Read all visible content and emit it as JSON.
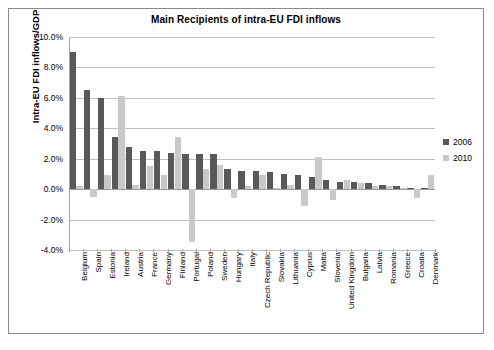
{
  "chart_data": {
    "type": "bar",
    "title": "Main Recipients of intra-EU FDI inflows",
    "xlabel": "",
    "ylabel": "Intra-EU FDI inflows/GDP",
    "ylim": [
      -4.0,
      10.0
    ],
    "ytick_step": 2.0,
    "ytick_labels": [
      "10.0%",
      "8.0%",
      "6.0%",
      "4.0%",
      "2.0%",
      "0.0%",
      "-2.0%",
      "-4.0%"
    ],
    "ytick_values": [
      10.0,
      8.0,
      6.0,
      4.0,
      2.0,
      0.0,
      -2.0,
      -4.0
    ],
    "grid": true,
    "legend_position": "right",
    "value_suffix": "%",
    "categories": [
      "Belgium",
      "Spain",
      "Estonia",
      "Ireland",
      "Austria",
      "France",
      "Germany",
      "Finland",
      "Portugal",
      "Poland",
      "Sweden",
      "Hungary",
      "Italy",
      "Czech Republic",
      "Slovakia",
      "Lithuania",
      "Cyprus",
      "Malta",
      "Slovenia",
      "United Kingdom",
      "Bulgaria",
      "Latvia",
      "Romania",
      "Greece",
      "Croatia",
      "Denmark"
    ],
    "series": [
      {
        "name": "2006",
        "color": "#595959",
        "values": [
          9.0,
          6.5,
          6.0,
          3.4,
          2.8,
          2.5,
          2.5,
          2.4,
          2.3,
          2.3,
          2.3,
          1.3,
          1.2,
          1.2,
          1.1,
          1.0,
          0.9,
          0.8,
          0.6,
          0.5,
          0.5,
          0.4,
          0.3,
          0.2,
          0.1,
          0.1
        ]
      },
      {
        "name": "2010",
        "color": "#c9c9c9",
        "values": [
          0.2,
          -0.5,
          0.9,
          6.1,
          0.3,
          1.5,
          0.9,
          3.4,
          -3.5,
          1.3,
          1.6,
          -0.6,
          0.2,
          0.9,
          0.1,
          0.3,
          -1.1,
          2.1,
          -0.7,
          0.6,
          0.4,
          0.2,
          0.2,
          0.1,
          -0.6,
          0.9
        ]
      }
    ]
  },
  "legend": {
    "items": [
      {
        "label": "2006"
      },
      {
        "label": "2010"
      }
    ]
  }
}
